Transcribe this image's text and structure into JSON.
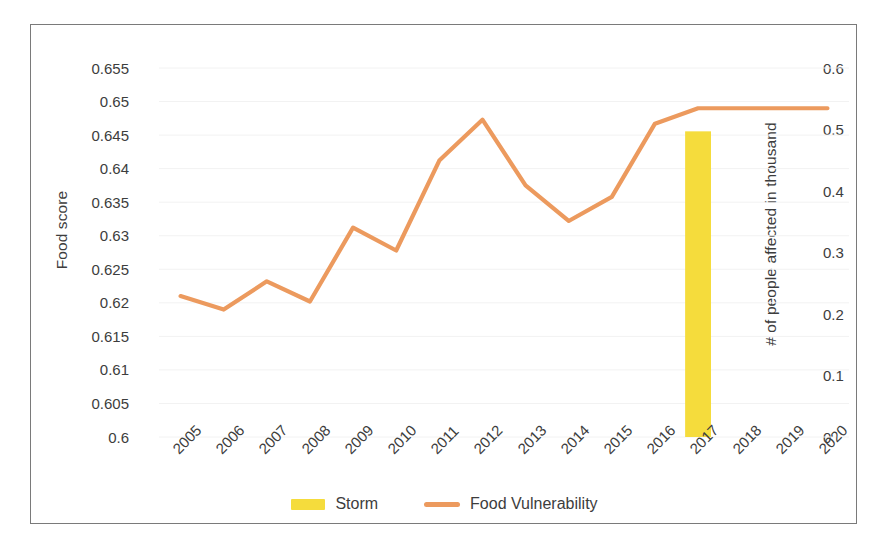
{
  "chart_data": {
    "type": "line",
    "title": "",
    "xlabel": "",
    "ylabel": "Food score",
    "y2label": "# of people affected in thousand",
    "grid": true,
    "legend_position": "bottom",
    "categories": [
      "2005",
      "2006",
      "2007",
      "2008",
      "2009",
      "2010",
      "2011",
      "2012",
      "2013",
      "2014",
      "2015",
      "2016",
      "2017",
      "2018",
      "2019",
      "2020"
    ],
    "ylim": [
      0.6,
      0.655
    ],
    "y2lim": [
      0,
      0.6
    ],
    "yticks": [
      "0.6",
      "0.605",
      "0.61",
      "0.615",
      "0.62",
      "0.625",
      "0.63",
      "0.635",
      "0.64",
      "0.645",
      "0.65",
      "0.655"
    ],
    "ytick_values": [
      0.6,
      0.605,
      0.61,
      0.615,
      0.62,
      0.625,
      0.63,
      0.635,
      0.64,
      0.645,
      0.65,
      0.655
    ],
    "y2ticks": [
      "0",
      "0.1",
      "0.2",
      "0.3",
      "0.4",
      "0.5",
      "0.6"
    ],
    "y2tick_values": [
      0,
      0.1,
      0.2,
      0.3,
      0.4,
      0.5,
      0.6
    ],
    "series": [
      {
        "name": "Storm",
        "type": "bar",
        "axis": "right",
        "color": "#F5DC3C",
        "values": [
          0,
          0,
          0,
          0,
          0,
          0,
          0,
          0,
          0,
          0,
          0,
          0,
          0.497,
          0,
          0,
          0
        ]
      },
      {
        "name": "Food Vulnerability",
        "type": "line",
        "axis": "left",
        "color": "#EC9A5E",
        "values": [
          0.621,
          0.619,
          0.6232,
          0.6202,
          0.6312,
          0.6278,
          0.6412,
          0.6473,
          0.6375,
          0.6322,
          0.6358,
          0.6467,
          0.649,
          0.649,
          0.649,
          0.649
        ]
      }
    ]
  },
  "legend": {
    "items": [
      {
        "label": "Storm",
        "color": "#F5DC3C",
        "marker": "bar-swatch"
      },
      {
        "label": "Food Vulnerability",
        "color": "#EC9A5E",
        "marker": "line-swatch"
      }
    ]
  },
  "colors": {
    "storm": "#F5DC3C",
    "food_vulnerability": "#EC9A5E",
    "frame": "#7a7a7a",
    "gridline": "#f2f2f2",
    "text": "#3d3d3d",
    "background": "#ffffff"
  }
}
